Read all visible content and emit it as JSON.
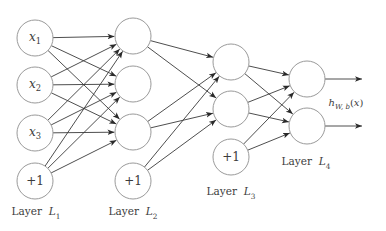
{
  "diagram": {
    "type": "feedforward-neural-network",
    "colors": {
      "node_stroke": "#9a9a9a",
      "edge": "#3a3a3a",
      "text": "#3c3c3c"
    },
    "node_radius": 18,
    "layers": [
      {
        "id": "L1",
        "label_prefix": "Layer ",
        "label_var": "L",
        "label_sub": "1",
        "label_pos": [
          36,
          213
        ],
        "nodes": [
          {
            "id": "x1",
            "var": "x",
            "sub": "1",
            "bias": false,
            "cx": 35,
            "cy": 38
          },
          {
            "id": "x2",
            "var": "x",
            "sub": "2",
            "bias": false,
            "cx": 35,
            "cy": 85
          },
          {
            "id": "x3",
            "var": "x",
            "sub": "3",
            "bias": false,
            "cx": 35,
            "cy": 133
          },
          {
            "id": "b1",
            "text": "+1",
            "bias": true,
            "cx": 35,
            "cy": 181
          }
        ]
      },
      {
        "id": "L2",
        "label_prefix": "Layer ",
        "label_var": "L",
        "label_sub": "2",
        "label_pos": [
          133,
          213
        ],
        "nodes": [
          {
            "id": "a21",
            "bias": false,
            "cx": 133,
            "cy": 36
          },
          {
            "id": "a22",
            "bias": false,
            "cx": 133,
            "cy": 84
          },
          {
            "id": "a23",
            "bias": false,
            "cx": 133,
            "cy": 132
          },
          {
            "id": "b2",
            "text": "+1",
            "bias": true,
            "cx": 133,
            "cy": 181
          }
        ]
      },
      {
        "id": "L3",
        "label_prefix": "Layer ",
        "label_var": "L",
        "label_sub": "3",
        "label_pos": [
          231,
          193
        ],
        "nodes": [
          {
            "id": "a31",
            "bias": false,
            "cx": 231,
            "cy": 62
          },
          {
            "id": "a32",
            "bias": false,
            "cx": 231,
            "cy": 109
          },
          {
            "id": "b3",
            "text": "+1",
            "bias": true,
            "cx": 231,
            "cy": 157
          }
        ]
      },
      {
        "id": "L4",
        "label_prefix": "Layer ",
        "label_var": "L",
        "label_sub": "4",
        "label_pos": [
          306,
          163
        ],
        "nodes": [
          {
            "id": "a41",
            "bias": false,
            "cx": 307,
            "cy": 79
          },
          {
            "id": "a42",
            "bias": false,
            "cx": 307,
            "cy": 126
          }
        ]
      }
    ],
    "edges": [
      [
        "x1",
        "a21"
      ],
      [
        "x1",
        "a22"
      ],
      [
        "x1",
        "a23"
      ],
      [
        "x2",
        "a21"
      ],
      [
        "x2",
        "a22"
      ],
      [
        "x2",
        "a23"
      ],
      [
        "x3",
        "a21"
      ],
      [
        "x3",
        "a22"
      ],
      [
        "x3",
        "a23"
      ],
      [
        "b1",
        "a21"
      ],
      [
        "b1",
        "a22"
      ],
      [
        "b1",
        "a23"
      ],
      [
        "a21",
        "a31"
      ],
      [
        "a21",
        "a32"
      ],
      [
        "a23",
        "a31"
      ],
      [
        "a23",
        "a32"
      ],
      [
        "b2",
        "a31"
      ],
      [
        "b2",
        "a32"
      ],
      [
        "a31",
        "a41"
      ],
      [
        "a31",
        "a42"
      ],
      [
        "a32",
        "a41"
      ],
      [
        "a32",
        "a42"
      ],
      [
        "b3",
        "a41"
      ],
      [
        "b3",
        "a42"
      ]
    ],
    "outputs": [
      {
        "from": "a41",
        "x2": 362
      },
      {
        "from": "a42",
        "x2": 362
      }
    ],
    "output_label": {
      "func": "h",
      "sub": "W, b",
      "arg": "(x)",
      "pos": [
        346,
        104
      ]
    }
  }
}
